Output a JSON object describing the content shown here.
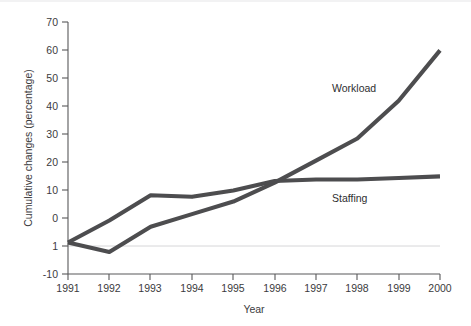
{
  "chart_data": {
    "type": "line",
    "title": "",
    "xlabel": "Year",
    "ylabel": "Cumulative changes (percentage)",
    "x": [
      1991,
      1992,
      1993,
      1994,
      1995,
      1996,
      1997,
      1998,
      1999,
      2000
    ],
    "xtick_labels": [
      "1991",
      "1992",
      "1993",
      "1994",
      "1995",
      "1996",
      "1997",
      "1998",
      "1999",
      "2000"
    ],
    "ytick_labels": [
      "-10",
      "0",
      "10",
      "20",
      "30",
      "40",
      "50",
      "60",
      "70"
    ],
    "ytick_values": [
      -10,
      0,
      10,
      20,
      30,
      40,
      50,
      60,
      70
    ],
    "xlim": [
      1991,
      2000
    ],
    "ylim": [
      -10,
      70
    ],
    "grid": false,
    "legend_position": "inline-annotation",
    "zero_reference_line": 0,
    "series": [
      {
        "name": "Workload",
        "values": [
          0,
          -3,
          5,
          9,
          13,
          19,
          26,
          33,
          45,
          61
        ],
        "color": "#4d4d4f",
        "label_x": 1997,
        "label_y": 47
      },
      {
        "name": "Staffing",
        "values": [
          0,
          7,
          15,
          14.5,
          16.5,
          19.5,
          20,
          20,
          20.5,
          21
        ],
        "color": "#4d4d4f",
        "label_x": 1997,
        "label_y": 13
      }
    ]
  },
  "labels": {
    "workload": "Workload",
    "staffing": "Staffing",
    "x_title": "Year",
    "y_title": "Cumulative changes (percentage)"
  },
  "colors": {
    "line": "#4d4d4f",
    "axis": "#58585a",
    "zero_rule": "#d6d6d8",
    "text": "#3b3b3d",
    "background": "#ffffff"
  }
}
